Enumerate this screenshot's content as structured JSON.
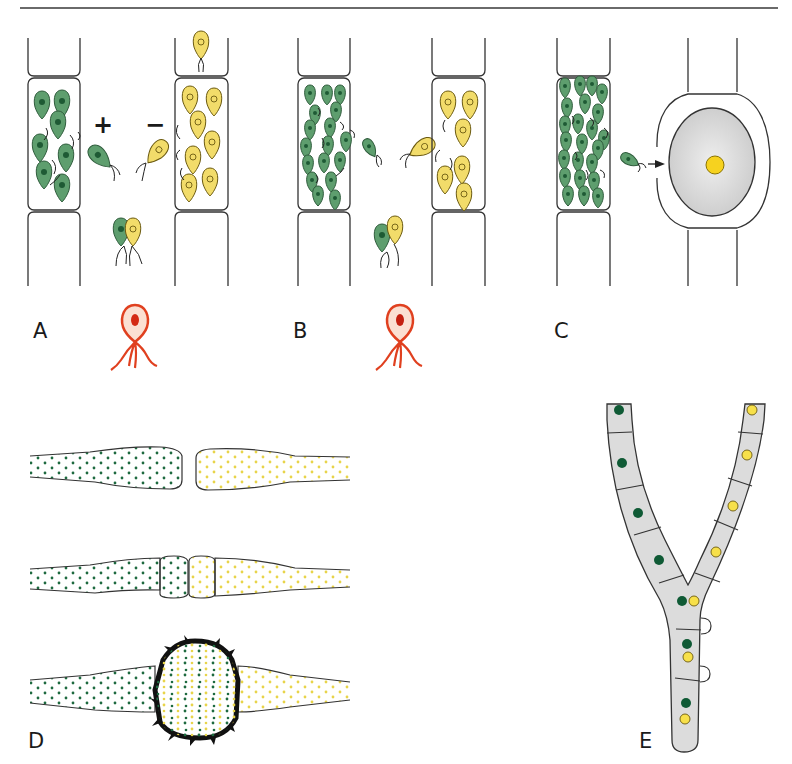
{
  "figure": {
    "panels": [
      {
        "id": "A",
        "label": "A",
        "description": "Gamete release from + and − filaments",
        "signs": {
          "plus": "+",
          "minus": "−"
        }
      },
      {
        "id": "B",
        "label": "B",
        "description": "Isogamy: gametes of both mating types fusing"
      },
      {
        "id": "C",
        "label": "C",
        "description": "Oogamy: motile gamete approaching egg cell in oogonium"
      },
      {
        "id": "D",
        "label": "D",
        "description": "Hyphal contact, gametangia and zygospore formation"
      },
      {
        "id": "E",
        "label": "E",
        "description": "Dikaryotic hypha with clamp connections"
      }
    ],
    "colors": {
      "plus_gamete": "#5e9e6e",
      "plus_nucleus": "#1e5a34",
      "minus_gamete": "#f2dc6a",
      "zygote_red": "#e0401f",
      "zygote_fill": "#fbe0d2",
      "egg_gray": "#d6d6d6",
      "egg_nucleus": "#f6d21f",
      "hypha_fill": "#dcdcdc",
      "nucleus_green": "#0f5a35",
      "nucleus_yellow": "#f7e04a"
    }
  }
}
